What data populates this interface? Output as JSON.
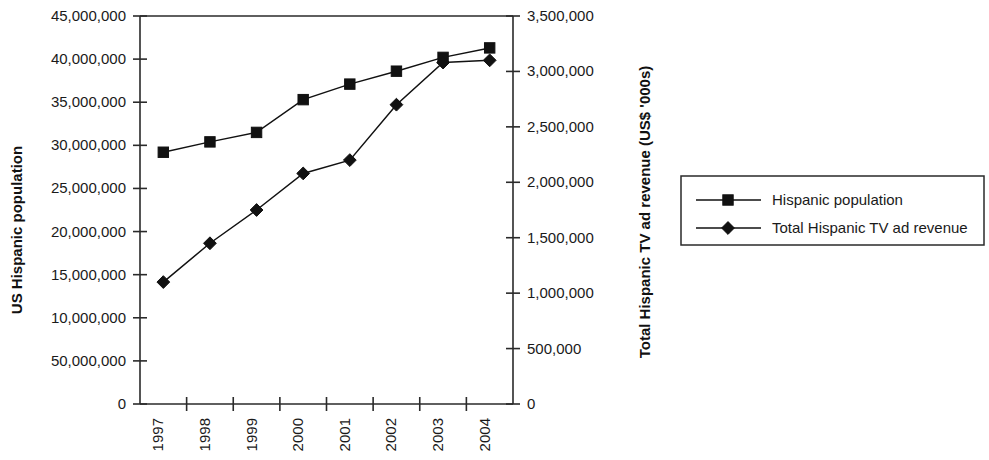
{
  "chart_data": {
    "type": "line",
    "title": "",
    "subtitle": "",
    "xlabel": "",
    "categories": [
      "1997",
      "1998",
      "1999",
      "2000",
      "2001",
      "2002",
      "2003",
      "2004"
    ],
    "grid": false,
    "legend_position": "right",
    "axes": {
      "left": {
        "label": "US Hispanic population",
        "min": 0,
        "max": 45000000,
        "tick_step": 5000000,
        "tick_labels": [
          "45,000,000",
          "40,000,000",
          "35,000,000",
          "30,000,000",
          "25,000,000",
          "20,000,000",
          "15,000,000",
          "10,000,000",
          "50,000,000",
          "0"
        ],
        "tick_values": [
          45000000,
          40000000,
          35000000,
          30000000,
          25000000,
          20000000,
          15000000,
          10000000,
          5000000,
          0
        ]
      },
      "right": {
        "label": "Total Hispanic TV ad revenue (US$ '000s)",
        "min": 0,
        "max": 3500000,
        "tick_step": 500000,
        "tick_labels": [
          "3,500,000",
          "3,000,000",
          "2,500,000",
          "2,000,000",
          "1,500,000",
          "1,000,000",
          "500,000",
          "0"
        ],
        "tick_values": [
          3500000,
          3000000,
          2500000,
          2000000,
          1500000,
          1000000,
          500000,
          0
        ]
      }
    },
    "series": [
      {
        "name": "Hispanic population",
        "axis": "left",
        "marker": "square",
        "values": [
          29200000,
          30400000,
          31500000,
          35300000,
          37100000,
          38600000,
          40200000,
          41300000
        ]
      },
      {
        "name": "Total Hispanic TV ad revenue",
        "axis": "right",
        "marker": "diamond",
        "values": [
          1100000,
          1450000,
          1750000,
          2080000,
          2200000,
          2700000,
          3080000,
          3100000
        ]
      }
    ]
  },
  "legend": {
    "items": [
      {
        "label": "Hispanic population",
        "marker": "square"
      },
      {
        "label": "Total Hispanic TV ad revenue",
        "marker": "diamond"
      }
    ]
  },
  "colors": {
    "ink": "#111111",
    "axis": "#2a2a2a",
    "background": "#ffffff"
  }
}
